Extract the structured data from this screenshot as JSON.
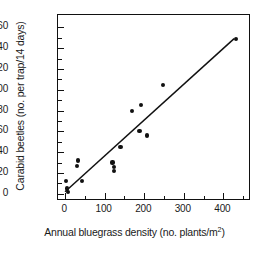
{
  "chart_data": {
    "type": "scatter",
    "title": "",
    "xlabel": "Annual bluegrass density (no. plants/m2)",
    "xlabel_main": "Annual bluegrass density (no. plants/m",
    "xlabel_sup": "2",
    "xlabel_tail": ")",
    "ylabel": "Carabid beetles (no. per trap/14 days)",
    "xlim": [
      -18,
      470
    ],
    "ylim": [
      -7,
      172
    ],
    "xticks": [
      0,
      100,
      200,
      300,
      400
    ],
    "xtick_labels": [
      "0",
      "100",
      "200",
      "300",
      "400"
    ],
    "xminor_ticks": [
      50,
      150,
      250,
      350,
      450
    ],
    "yticks": [
      0,
      20,
      40,
      60,
      80,
      100,
      120,
      140,
      160
    ],
    "ytick_labels": [
      "0",
      "20",
      "40",
      "60",
      "80",
      "100",
      "120",
      "140",
      "160"
    ],
    "yminor_ticks": [
      10,
      30,
      50,
      70,
      90,
      110,
      130,
      150
    ],
    "grid": false,
    "legend": false,
    "marker": "filled-circle",
    "marker_color": "#111111",
    "line_color": "#111111",
    "frame_color": "#111111",
    "background": "#ffffff",
    "points": [
      {
        "x": 3,
        "y": 12
      },
      {
        "x": 5,
        "y": 5
      },
      {
        "x": 8,
        "y": 2
      },
      {
        "x": 30,
        "y": 27
      },
      {
        "x": 33,
        "y": 32
      },
      {
        "x": 42,
        "y": 12
      },
      {
        "x": 120,
        "y": 30
      },
      {
        "x": 124,
        "y": 26
      },
      {
        "x": 124,
        "y": 22
      },
      {
        "x": 140,
        "y": 45
      },
      {
        "x": 170,
        "y": 80
      },
      {
        "x": 188,
        "y": 60
      },
      {
        "x": 192,
        "y": 85
      },
      {
        "x": 207,
        "y": 56
      },
      {
        "x": 247,
        "y": 105
      },
      {
        "x": 432,
        "y": 149
      }
    ],
    "fit_line": {
      "x1": 0,
      "y1": 0,
      "x2": 432,
      "y2": 149,
      "description": "linear regression trend line"
    }
  }
}
